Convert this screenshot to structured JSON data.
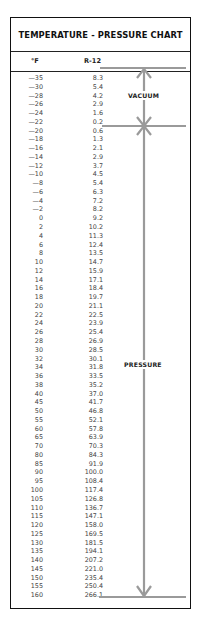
{
  "chart": {
    "title": "TEMPERATURE - PRESSURE CHART",
    "col_temp": "°F",
    "col_pressure": "R-12",
    "region_vacuum": "VACUUM",
    "region_pressure": "PRESSURE"
  },
  "rows": [
    {
      "t": "—35",
      "p": "8.3"
    },
    {
      "t": "—30",
      "p": "5.4"
    },
    {
      "t": "—28",
      "p": "4.2"
    },
    {
      "t": "—26",
      "p": "2.9"
    },
    {
      "t": "—24",
      "p": "1.6"
    },
    {
      "t": "—22",
      "p": "0.2"
    },
    {
      "t": "—20",
      "p": "0.6"
    },
    {
      "t": "—18",
      "p": "1.3"
    },
    {
      "t": "—16",
      "p": "2.1"
    },
    {
      "t": "—14",
      "p": "2.9"
    },
    {
      "t": "—12",
      "p": "3.7"
    },
    {
      "t": "—10",
      "p": "4.5"
    },
    {
      "t": "—8",
      "p": "5.4"
    },
    {
      "t": "—6",
      "p": "6.3"
    },
    {
      "t": "—4",
      "p": "7.2"
    },
    {
      "t": "—2",
      "p": "8.2"
    },
    {
      "t": "0",
      "p": "9.2"
    },
    {
      "t": "2",
      "p": "10.2"
    },
    {
      "t": "4",
      "p": "11.3"
    },
    {
      "t": "6",
      "p": "12.4"
    },
    {
      "t": "8",
      "p": "13.5"
    },
    {
      "t": "10",
      "p": "14.7"
    },
    {
      "t": "12",
      "p": "15.9"
    },
    {
      "t": "14",
      "p": "17.1"
    },
    {
      "t": "16",
      "p": "18.4"
    },
    {
      "t": "18",
      "p": "19.7"
    },
    {
      "t": "20",
      "p": "21.1"
    },
    {
      "t": "22",
      "p": "22.5"
    },
    {
      "t": "24",
      "p": "23.9"
    },
    {
      "t": "26",
      "p": "25.4"
    },
    {
      "t": "28",
      "p": "26.9"
    },
    {
      "t": "30",
      "p": "28.5"
    },
    {
      "t": "32",
      "p": "30.1"
    },
    {
      "t": "34",
      "p": "31.8"
    },
    {
      "t": "36",
      "p": "33.5"
    },
    {
      "t": "38",
      "p": "35.2"
    },
    {
      "t": "40",
      "p": "37.0"
    },
    {
      "t": "45",
      "p": "41.7"
    },
    {
      "t": "50",
      "p": "46.8"
    },
    {
      "t": "55",
      "p": "52.1"
    },
    {
      "t": "60",
      "p": "57.8"
    },
    {
      "t": "65",
      "p": "63.9"
    },
    {
      "t": "70",
      "p": "70.3"
    },
    {
      "t": "80",
      "p": "84.3"
    },
    {
      "t": "85",
      "p": "91.9"
    },
    {
      "t": "90",
      "p": "100.0"
    },
    {
      "t": "95",
      "p": "108.4"
    },
    {
      "t": "100",
      "p": "117.4"
    },
    {
      "t": "105",
      "p": "126.8"
    },
    {
      "t": "110",
      "p": "136.7"
    },
    {
      "t": "115",
      "p": "147.1"
    },
    {
      "t": "120",
      "p": "158.0"
    },
    {
      "t": "125",
      "p": "169.5"
    },
    {
      "t": "130",
      "p": "181.5"
    },
    {
      "t": "135",
      "p": "194.1"
    },
    {
      "t": "140",
      "p": "207.2"
    },
    {
      "t": "145",
      "p": "221.0"
    },
    {
      "t": "150",
      "p": "235.4"
    },
    {
      "t": "155",
      "p": "250.4"
    },
    {
      "t": "160",
      "p": "266.1"
    }
  ],
  "chart_data": {
    "type": "table",
    "title": "TEMPERATURE - PRESSURE CHART",
    "columns": [
      "°F",
      "R-12"
    ],
    "x": [
      -35,
      -30,
      -28,
      -26,
      -24,
      -22,
      -20,
      -18,
      -16,
      -14,
      -12,
      -10,
      -8,
      -6,
      -4,
      -2,
      0,
      2,
      4,
      6,
      8,
      10,
      12,
      14,
      16,
      18,
      20,
      22,
      24,
      26,
      28,
      30,
      32,
      34,
      36,
      38,
      40,
      45,
      50,
      55,
      60,
      65,
      70,
      80,
      85,
      90,
      95,
      100,
      105,
      110,
      115,
      120,
      125,
      130,
      135,
      140,
      145,
      150,
      155,
      160
    ],
    "series": [
      {
        "name": "R-12",
        "values": [
          8.3,
          5.4,
          4.2,
          2.9,
          1.6,
          0.2,
          0.6,
          1.3,
          2.1,
          2.9,
          3.7,
          4.5,
          5.4,
          6.3,
          7.2,
          8.2,
          9.2,
          10.2,
          11.3,
          12.4,
          13.5,
          14.7,
          15.9,
          17.1,
          18.4,
          19.7,
          21.1,
          22.5,
          23.9,
          25.4,
          26.9,
          28.5,
          30.1,
          31.8,
          33.5,
          35.2,
          37.0,
          41.7,
          46.8,
          52.1,
          57.8,
          63.9,
          70.3,
          84.3,
          91.9,
          100.0,
          108.4,
          117.4,
          126.8,
          136.7,
          147.1,
          158.0,
          169.5,
          181.5,
          194.1,
          207.2,
          221.0,
          235.4,
          250.4,
          266.1
        ]
      }
    ],
    "annotations": [
      {
        "label": "VACUUM",
        "range_temp": [
          -35,
          -22
        ]
      },
      {
        "label": "PRESSURE",
        "range_temp": [
          -20,
          160
        ]
      }
    ]
  }
}
